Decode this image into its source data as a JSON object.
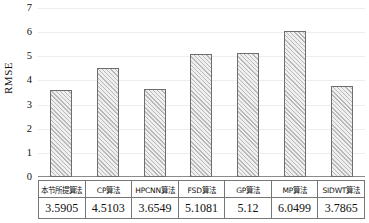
{
  "chart_data": {
    "type": "bar",
    "title": "",
    "xlabel": "",
    "ylabel": "RMSE",
    "ylim": [
      0,
      7
    ],
    "ytick_values": [
      7,
      6,
      5,
      4,
      3,
      2,
      1,
      0
    ],
    "grid": true,
    "legend": null,
    "categories": [
      "本节所提算法",
      "CP算法",
      "HPCNN算法",
      "FSD算法",
      "GP算法",
      "MP算法",
      "SIDWT算法"
    ],
    "values": [
      3.5905,
      4.5103,
      3.6549,
      5.1081,
      5.12,
      6.0499,
      3.7865
    ],
    "value_labels": [
      "3.5905",
      "4.5103",
      "3.6549",
      "5.1081",
      "5.12",
      "6.0499",
      "3.7865"
    ],
    "bar_style": {
      "fill": "#efefef",
      "hatch": "diagonal",
      "hatch_color": "#b9b9b9",
      "edge": "#6e6e6e"
    },
    "axis_color": "#8a8a8a",
    "gridline_color": "#ededed"
  },
  "data_table": {
    "header_row": [
      "本节所提算法",
      "CP算法",
      "HPCNN算法",
      "FSD算法",
      "GP算法",
      "MP算法",
      "SIDWT算法"
    ],
    "value_row": [
      "3.5905",
      "4.5103",
      "3.6549",
      "5.1081",
      "5.12",
      "6.0499",
      "3.7865"
    ]
  }
}
